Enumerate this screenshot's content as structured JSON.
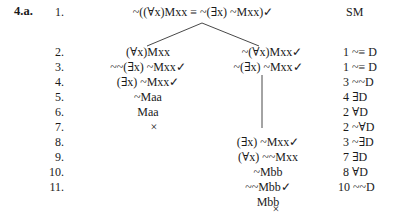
{
  "problem_label": "4.a.",
  "line_numbers": [
    "1.",
    "2.",
    "3.",
    "4.",
    "5.",
    "6.",
    "7.",
    "8.",
    "9.",
    "10.",
    "11."
  ],
  "root": {
    "formula": "~((∀x)Mxx ≡ ~(∃x) ~Mxx)✓",
    "justification": "SM"
  },
  "left_branch": [
    "(∀x)Mxx",
    "~~(∃x) ~Mxx✓",
    "(∃x) ~Mxx✓",
    "~Maa",
    "Maa",
    "×"
  ],
  "right_branch": [
    "~(∀x)Mxx✓",
    "~(∃x) ~Mxx✓",
    "(∃x) ~Mxx✓",
    "(∀x) ~~Mxx",
    "~Mbb",
    "~~Mbb✓",
    "Mbb",
    "×"
  ],
  "justifications": [
    "SM",
    "1  ~≡ D",
    "1  ~≡ D",
    "3  ~~D",
    "4 ∃D",
    "2 ∀D",
    "2  ~∀D",
    "3  ~∃D",
    "7 ∃D",
    "8 ∀D",
    "10  ~~D"
  ],
  "colors": {
    "text": "#1a1a1a",
    "lines": "#333333",
    "background": "#ffffff"
  }
}
